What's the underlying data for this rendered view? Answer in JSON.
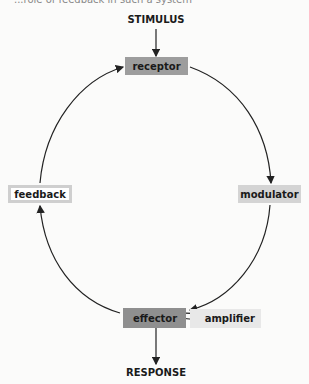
{
  "caption": "...role of feedback in such a system",
  "input_label": "STIMULUS",
  "output_label": "RESPONSE",
  "nodes": {
    "receptor": "receptor",
    "modulator": "modulator",
    "effector": "effector",
    "amplifier": "amplifier",
    "feedback": "feedback"
  },
  "colors": {
    "receptor": "#9d9d9d",
    "modulator": "#d4d4d4",
    "effector": "#8f8f8f",
    "amplifier": "#e8e8e8",
    "feedback_border": "#cfcfcf"
  }
}
